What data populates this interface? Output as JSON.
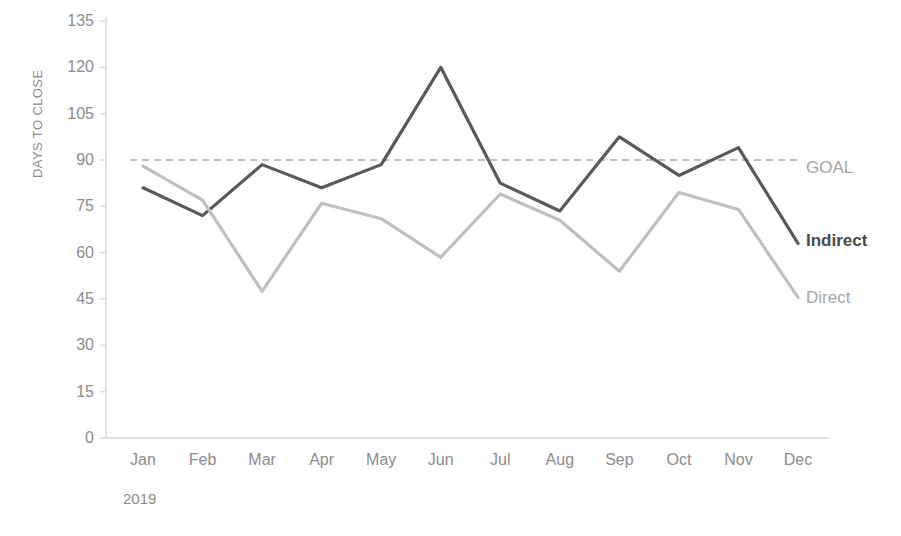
{
  "chart_data": {
    "type": "line",
    "title": "",
    "xlabel": "2019",
    "ylabel": "DAYS TO CLOSE",
    "categories": [
      "Jan",
      "Feb",
      "Mar",
      "Apr",
      "May",
      "Jun",
      "Jul",
      "Aug",
      "Sep",
      "Oct",
      "Nov",
      "Dec"
    ],
    "ylim": [
      0,
      135
    ],
    "yticks": [
      135,
      120,
      105,
      90,
      75,
      60,
      45,
      30,
      15,
      0
    ],
    "grid": false,
    "legend_position": "right-inline",
    "series": [
      {
        "name": "Indirect",
        "color": "#595959",
        "style": "solid",
        "values": [
          81,
          72,
          88.5,
          81,
          88.5,
          120,
          82.5,
          73.5,
          97.5,
          85,
          94,
          63
        ]
      },
      {
        "name": "Direct",
        "color": "#bfbfbf",
        "style": "solid",
        "values": [
          88,
          77,
          47.5,
          76,
          71,
          58.5,
          79,
          70.5,
          54,
          79.5,
          74,
          45.5
        ]
      }
    ],
    "reference_line": {
      "name": "GOAL",
      "value": 90,
      "color": "#bfbfbf",
      "style": "dashed"
    },
    "annotations": [
      {
        "text": "GOAL",
        "series": "reference",
        "bold": false,
        "color": "#a6a6a6"
      },
      {
        "text": "Indirect",
        "series": "Indirect",
        "bold": true,
        "color": "#4a4a4a"
      },
      {
        "text": "Direct",
        "series": "Direct",
        "bold": false,
        "color": "#a6a6a6"
      }
    ]
  },
  "axis": {
    "y_title": "DAYS TO CLOSE",
    "y_tick_labels": [
      "135",
      "120",
      "105",
      "90",
      "75",
      "60",
      "45",
      "30",
      "15",
      "0"
    ],
    "x_tick_labels": [
      "Jan",
      "Feb",
      "Mar",
      "Apr",
      "May",
      "Jun",
      "Jul",
      "Aug",
      "Sep",
      "Oct",
      "Nov",
      "Dec"
    ],
    "period": "2019",
    "axis_color": "#d9d9d9",
    "text_color": "#8c8c8c"
  },
  "labels": {
    "goal": "GOAL",
    "indirect": "Indirect",
    "direct": "Direct"
  }
}
